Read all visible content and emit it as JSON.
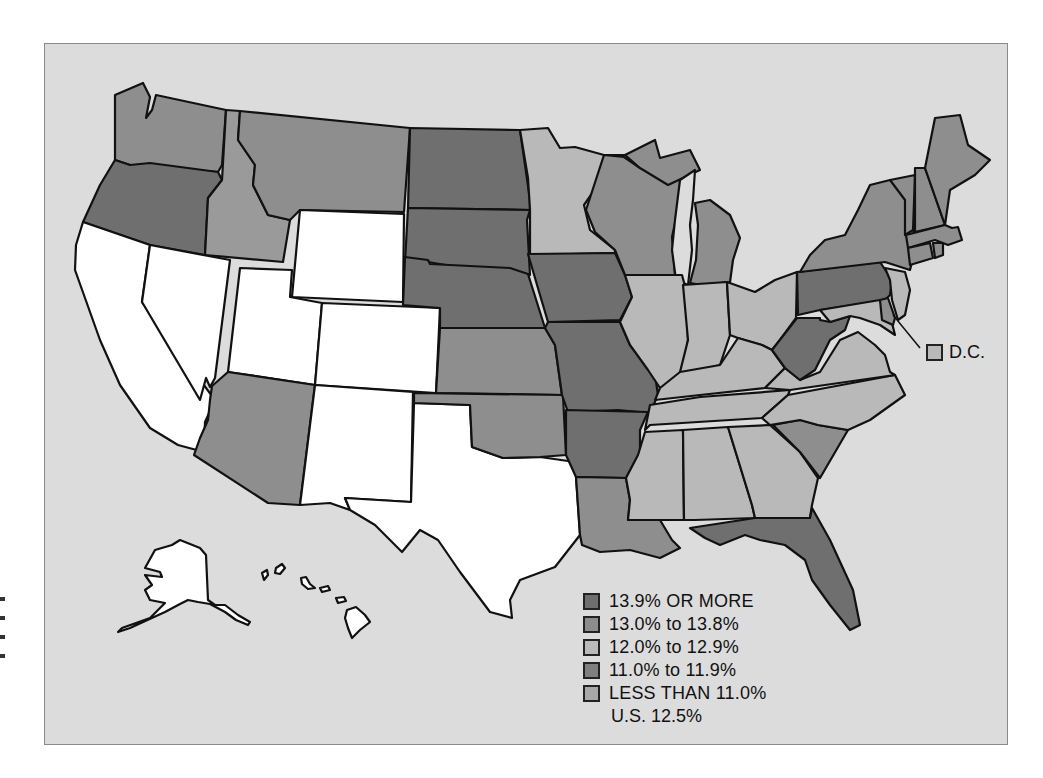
{
  "map": {
    "subject": "Percent by state, United States",
    "classes": [
      {
        "id": "c1",
        "label": "13.9% OR MORE",
        "swatch": "#6e6e6e",
        "fill": "#6f6f6f"
      },
      {
        "id": "c2",
        "label": "13.0% to 13.8%",
        "swatch": "#8c8c8c",
        "fill": "#8e8e8e"
      },
      {
        "id": "c3",
        "label": "12.0% to 12.9%",
        "swatch": "#b9b9b9",
        "fill": "#b9b9b9"
      },
      {
        "id": "c4",
        "label": "11.0% to 11.9%",
        "swatch": "#7f7f7f",
        "fill": "#9a9a9a"
      },
      {
        "id": "c5",
        "label": "LESS THAN 11.0%",
        "swatch": "#a8a8a8",
        "fill": "#ffffff"
      }
    ],
    "us_average": "U.S. 12.5%",
    "dc": {
      "label": "D.C.",
      "class": "c3"
    },
    "background": "#dcdcdc",
    "states": {
      "WA": "c2",
      "OR": "c1",
      "CA": "c5",
      "ID": "c4",
      "NV": "c5",
      "MT": "c2",
      "WY": "c5",
      "UT": "c5",
      "CO": "c5",
      "AZ": "c2",
      "NM": "c5",
      "TX": "c5",
      "ND": "c1",
      "SD": "c1",
      "NE": "c1",
      "KS": "c2",
      "OK": "c2",
      "MN": "c3",
      "IA": "c1",
      "MO": "c1",
      "AR": "c1",
      "LA": "c2",
      "WI": "c2",
      "IL": "c3",
      "MI": "c2",
      "IN": "c3",
      "OH": "c3",
      "KY": "c3",
      "TN": "c3",
      "MS": "c3",
      "AL": "c3",
      "GA": "c3",
      "FL": "c1",
      "SC": "c2",
      "NC": "c3",
      "VA": "c3",
      "WV": "c1",
      "PA": "c1",
      "NY": "c2",
      "VT": "c2",
      "NH": "c2",
      "ME": "c2",
      "MA": "c2",
      "CT": "c2",
      "RI": "c2",
      "NJ": "c3",
      "DE": "c2",
      "MD": "c3",
      "AK": "c5",
      "HI": "c5"
    }
  }
}
